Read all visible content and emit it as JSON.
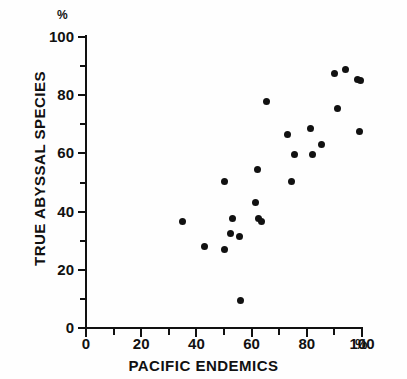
{
  "chart_data": {
    "type": "scatter",
    "title": "",
    "xlabel": "PACIFIC ENDEMICS",
    "ylabel": "TRUE ABYSSAL SPECIES",
    "x_unit": "%",
    "y_unit": "%",
    "xlim": [
      0,
      100
    ],
    "ylim": [
      0,
      100
    ],
    "x_ticks": [
      0,
      20,
      40,
      60,
      80,
      100
    ],
    "x_minor_ticks": [
      10,
      30,
      50,
      70,
      90
    ],
    "y_ticks": [
      0,
      20,
      40,
      60,
      80,
      100
    ],
    "y_minor_ticks": [
      10,
      30,
      50,
      70,
      90
    ],
    "grid": false,
    "legend": null,
    "marker": "filled-circle",
    "marker_color": "#111111",
    "points": [
      {
        "x": 35,
        "y": 36.5
      },
      {
        "x": 43,
        "y": 28
      },
      {
        "x": 50,
        "y": 50.5
      },
      {
        "x": 50,
        "y": 27
      },
      {
        "x": 52.5,
        "y": 32.5
      },
      {
        "x": 53,
        "y": 37.5
      },
      {
        "x": 55.5,
        "y": 31.5
      },
      {
        "x": 56,
        "y": 9.5
      },
      {
        "x": 61.5,
        "y": 43
      },
      {
        "x": 62,
        "y": 54.5
      },
      {
        "x": 62.5,
        "y": 37.5
      },
      {
        "x": 63.5,
        "y": 36.5
      },
      {
        "x": 65.5,
        "y": 78
      },
      {
        "x": 73,
        "y": 66.5
      },
      {
        "x": 74.5,
        "y": 50.5
      },
      {
        "x": 75.5,
        "y": 59.5
      },
      {
        "x": 81.5,
        "y": 68.5
      },
      {
        "x": 82,
        "y": 59.5
      },
      {
        "x": 85.5,
        "y": 63
      },
      {
        "x": 90,
        "y": 87.5
      },
      {
        "x": 91,
        "y": 75.5
      },
      {
        "x": 94,
        "y": 89
      },
      {
        "x": 98.5,
        "y": 85.5
      },
      {
        "x": 99.5,
        "y": 85
      },
      {
        "x": 99,
        "y": 67.5
      }
    ]
  },
  "axis": {
    "y_unit_label": "%",
    "x_unit_label": "%",
    "x_title": "PACIFIC ENDEMICS",
    "y_title": "TRUE ABYSSAL SPECIES"
  }
}
